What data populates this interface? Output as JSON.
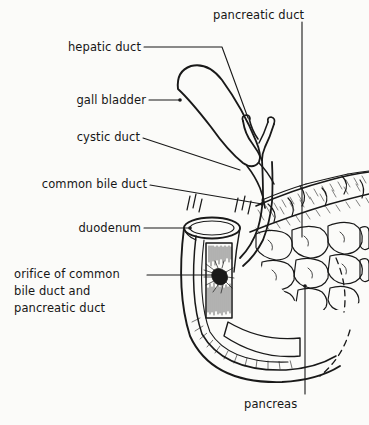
{
  "figure": {
    "background_color": "#fbfbf9",
    "ink_color": "#161616",
    "width": 369,
    "height": 425
  },
  "labels": {
    "pancreatic_duct": "pancreatic duct",
    "hepatic_duct": "hepatic duct",
    "gall_bladder": "gall bladder",
    "cystic_duct": "cystic duct",
    "common_bile_duct": "common bile duct",
    "duodenum": "duodenum",
    "orifice_line1": "orifice of common",
    "orifice_line2": "bile duct and",
    "orifice_line3": "pancreatic duct",
    "pancreas": "pancreas"
  },
  "structures": [
    {
      "name": "gall-bladder",
      "description": "pear shaped sac, upper left of duct tree"
    },
    {
      "name": "hepatic-duct",
      "description": "Y shaped duct branching at top"
    },
    {
      "name": "cystic-duct",
      "description": "duct from gall bladder neck to common bile duct"
    },
    {
      "name": "common-bile-duct",
      "description": "descending duct entering duodenum wall"
    },
    {
      "name": "duodenum",
      "description": "cut open C shaped bowel with mucosal villi"
    },
    {
      "name": "duodenal-orifice",
      "description": "dark papilla opening on posterior wall"
    },
    {
      "name": "pancreas",
      "description": "lobulated gland to the right, cobblestone texture"
    },
    {
      "name": "pancreatic-duct",
      "description": "duct running within pancreas body"
    }
  ]
}
